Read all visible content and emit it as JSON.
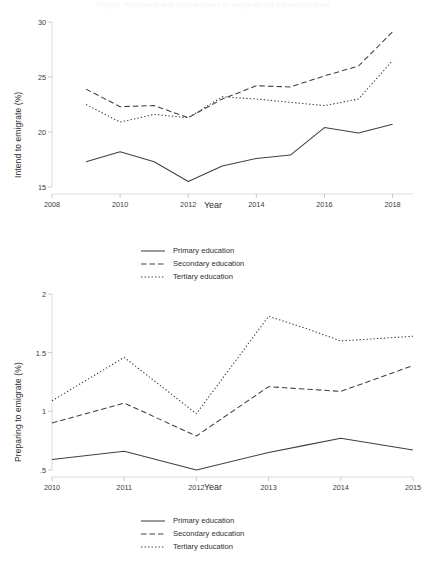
{
  "figure": {
    "faint_cropped_title": "Figure: Intentions and preparations to emigrate by education level"
  },
  "chart_data": [
    {
      "id": "intend-to-emigrate",
      "type": "line",
      "title": "",
      "xlabel": "Year",
      "ylabel": "Intend to emigrate (%)",
      "xlim": [
        2008,
        2018.6
      ],
      "ylim": [
        15,
        30
      ],
      "xticks": [
        "2008",
        "2010",
        "2012",
        "2014",
        "2016",
        "2018"
      ],
      "xtick_values": [
        2008,
        2010,
        2012,
        2014,
        2016,
        2018
      ],
      "yticks": [
        "15",
        "20",
        "25",
        "30"
      ],
      "ytick_values": [
        15,
        20,
        25,
        30
      ],
      "grid": false,
      "legend_position": "below",
      "x": [
        2009,
        2010,
        2011,
        2012,
        2013,
        2014,
        2015,
        2016,
        2017,
        2018
      ],
      "series": [
        {
          "name": "Primary education",
          "style": "solid",
          "values": [
            17.3,
            18.2,
            17.3,
            15.5,
            16.9,
            17.6,
            17.9,
            20.4,
            19.9,
            20.7
          ]
        },
        {
          "name": "Secondary education",
          "style": "dashed",
          "values": [
            23.9,
            22.3,
            22.4,
            21.3,
            23.0,
            24.2,
            24.1,
            25.1,
            26.0,
            29.1
          ]
        },
        {
          "name": "Tertiary education",
          "style": "dotted",
          "values": [
            22.5,
            20.9,
            21.6,
            21.3,
            23.2,
            23.0,
            22.7,
            22.4,
            23.0,
            26.5
          ]
        }
      ]
    },
    {
      "id": "preparing-to-emigrate",
      "type": "line",
      "title": "",
      "xlabel": "Year",
      "ylabel": "Preparing to emigrate (%)",
      "xlim": [
        2010,
        2015
      ],
      "ylim": [
        0.5,
        2
      ],
      "xticks": [
        "2010",
        "2011",
        "2012",
        "2013",
        "2014",
        "2015"
      ],
      "xtick_values": [
        2010,
        2011,
        2012,
        2013,
        2014,
        2015
      ],
      "yticks": [
        ".5",
        "1",
        "1.5",
        "2"
      ],
      "ytick_values": [
        0.5,
        1,
        1.5,
        2
      ],
      "grid": false,
      "legend_position": "below",
      "x": [
        2010,
        2011,
        2012,
        2013,
        2013.5,
        2014,
        2015
      ],
      "series": [
        {
          "name": "Primary education",
          "style": "solid",
          "values": [
            0.59,
            0.66,
            0.5,
            0.65,
            0.71,
            0.77,
            0.67
          ]
        },
        {
          "name": "Secondary education",
          "style": "dashed",
          "values": [
            0.9,
            1.07,
            0.79,
            1.21,
            1.19,
            1.17,
            1.39
          ]
        },
        {
          "name": "Tertiary education",
          "style": "dotted",
          "values": [
            1.09,
            1.46,
            0.98,
            1.81,
            1.71,
            1.6,
            1.64
          ]
        }
      ]
    }
  ],
  "legend": {
    "items": [
      {
        "label": "Primary education",
        "style": "solid"
      },
      {
        "label": "Secondary education",
        "style": "dashed"
      },
      {
        "label": "Tertiary education",
        "style": "dotted"
      }
    ]
  }
}
